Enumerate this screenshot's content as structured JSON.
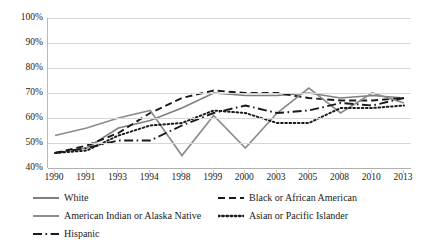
{
  "chart_data": {
    "type": "line",
    "title": "",
    "subtitle": "",
    "xlabel": "",
    "ylabel": "",
    "grid": true,
    "legend_position": "bottom",
    "categories": [
      "1990",
      "1991",
      "1993",
      "1994",
      "1998",
      "1999",
      "2000",
      "2003",
      "2005",
      "2008",
      "2010",
      "2013"
    ],
    "ytick_labels": [
      "40%",
      "50%",
      "60%",
      "70%",
      "80%",
      "90%",
      "100%"
    ],
    "ytick_values": [
      40,
      50,
      60,
      70,
      80,
      90,
      100
    ],
    "ylim": [
      40,
      100
    ],
    "series": [
      {
        "name": "White",
        "style": "solid",
        "color": "#7f7f7f",
        "values": [
          46,
          48,
          56,
          59,
          64,
          70,
          69,
          69,
          70,
          68,
          69,
          68
        ]
      },
      {
        "name": "Black or African American",
        "style": "dashed",
        "color": "#1a1a1a",
        "values": [
          46,
          49,
          54,
          62,
          68,
          71,
          70,
          70,
          68,
          67,
          67,
          68
        ]
      },
      {
        "name": "American Indian or Alaska Native",
        "style": "solid",
        "color": "#8c8c8c",
        "values": [
          53,
          56,
          60,
          63,
          45,
          61,
          48,
          62,
          72,
          62,
          70,
          66
        ]
      },
      {
        "name": "Asian or Pacific Islander",
        "style": "dotted",
        "color": "#1a1a1a",
        "values": [
          46,
          47,
          53,
          57,
          58,
          63,
          62,
          58,
          58,
          64,
          64,
          65
        ]
      },
      {
        "name": "Hispanic",
        "style": "dash-dot",
        "color": "#1a1a1a",
        "values": [
          46,
          48,
          51,
          51,
          57,
          62,
          65,
          62,
          63,
          66,
          65,
          68
        ]
      }
    ]
  },
  "legend": {
    "items": [
      {
        "label": "White",
        "swatch": "solid-gray-line-icon"
      },
      {
        "label": "Black or African American",
        "swatch": "dashed-black-line-icon"
      },
      {
        "label": "American Indian or Alaska Native",
        "swatch": "solid-gray-line-icon"
      },
      {
        "label": "Asian or Pacific Islander",
        "swatch": "dotted-black-line-icon"
      },
      {
        "label": "Hispanic",
        "swatch": "dash-dot-black-line-icon"
      }
    ]
  }
}
